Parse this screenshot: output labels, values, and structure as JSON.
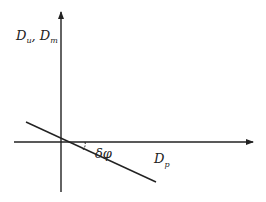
{
  "diagram": {
    "y_axis_label": "D",
    "y_axis_sub1": "u",
    "y_axis_sep": ", D",
    "y_axis_sub2": "m",
    "x_axis_label": "D",
    "x_axis_sub": "p",
    "angle_label": "δφ",
    "stroke_color": "#222222"
  }
}
